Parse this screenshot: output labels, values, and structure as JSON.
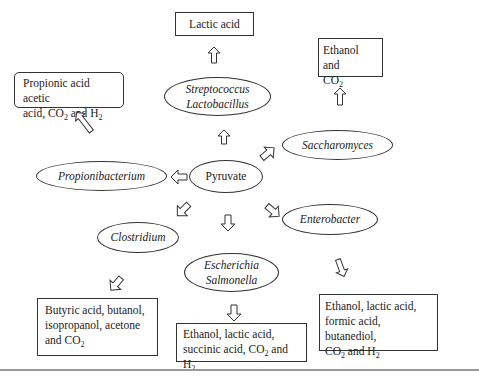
{
  "center": {
    "label": "Pyruvate"
  },
  "organisms": {
    "streptococcus": {
      "line1": "Streptococcus",
      "line2": "Lactobacillus"
    },
    "saccharomyces": {
      "label": "Saccharomyces"
    },
    "propionibacterium": {
      "label": "Propionibacterium"
    },
    "enterobacter": {
      "label": "Enterobacter"
    },
    "clostridium": {
      "label": "Clostridium"
    },
    "escherichia": {
      "line1": "Escherichia",
      "line2": "Salmonella"
    }
  },
  "products": {
    "lactic": {
      "line1": "Lactic acid"
    },
    "ethanol_co2": {
      "line1": "Ethanol and",
      "line2_pre": "CO",
      "line2_sub": "2"
    },
    "propionic": {
      "line1": "Propionic acid acetic",
      "line2_pre": "acid, CO",
      "line2_sub1": "2",
      "line2_mid": " and H",
      "line2_sub2": "2"
    },
    "butyric": {
      "line1": "Butyric acid, butanol,",
      "line2": "isopropanol, acetone",
      "line3_pre": "and CO",
      "line3_sub": "2"
    },
    "escherichia_products": {
      "line1": "Ethanol, lactic acid,",
      "line2_pre": "succinic acid, CO",
      "line2_sub1": "2",
      "line2_mid": " and H",
      "line2_sub2": "2"
    },
    "enterobacter_products": {
      "line1": "Ethanol, lactic acid,",
      "line2": "formic acid, butanediol,",
      "line3_pre": "CO",
      "line3_sub1": "2",
      "line3_mid": " and H",
      "line3_sub2": "2"
    }
  },
  "arrows": [
    {
      "from": "Pyruvate",
      "to": "Streptococcus/Lactobacillus",
      "direction": "up"
    },
    {
      "from": "Streptococcus/Lactobacillus",
      "to": "Lactic acid",
      "direction": "up"
    },
    {
      "from": "Pyruvate",
      "to": "Saccharomyces",
      "direction": "up-right"
    },
    {
      "from": "Saccharomyces",
      "to": "Ethanol and CO2",
      "direction": "up"
    },
    {
      "from": "Pyruvate",
      "to": "Propionibacterium",
      "direction": "left"
    },
    {
      "from": "Propionibacterium",
      "to": "Propionic acid acetic acid, CO2 and H2",
      "direction": "up-left"
    },
    {
      "from": "Pyruvate",
      "to": "Enterobacter",
      "direction": "down-right"
    },
    {
      "from": "Enterobacter",
      "to": "Ethanol, lactic acid, formic acid, butanediol, CO2 and H2",
      "direction": "down"
    },
    {
      "from": "Pyruvate",
      "to": "Clostridium",
      "direction": "down-left"
    },
    {
      "from": "Clostridium",
      "to": "Butyric acid, butanol, isopropanol, acetone and CO2",
      "direction": "down-left"
    },
    {
      "from": "Pyruvate",
      "to": "Escherichia/Salmonella",
      "direction": "down"
    },
    {
      "from": "Escherichia/Salmonella",
      "to": "Ethanol, lactic acid, succinic acid, CO2 and H2",
      "direction": "down"
    }
  ]
}
